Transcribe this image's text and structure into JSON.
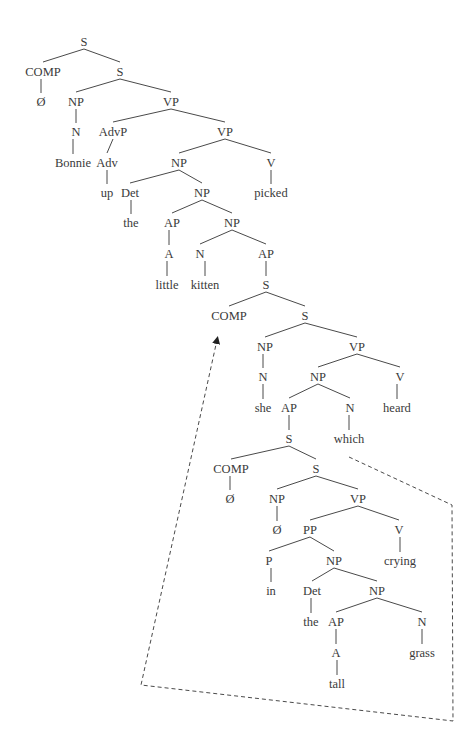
{
  "diagram": {
    "type": "syntax-tree",
    "sentence": "Bonnie up the little kitten she heard which in the tall grass crying picked",
    "nodes": [
      {
        "id": "s0",
        "label": "S",
        "x": 84,
        "y": 42
      },
      {
        "id": "comp0",
        "label": "COMP",
        "x": 43,
        "y": 72
      },
      {
        "id": "null0",
        "label": "Ø",
        "x": 41,
        "y": 102
      },
      {
        "id": "s1",
        "label": "S",
        "x": 120,
        "y": 72
      },
      {
        "id": "np1",
        "label": "NP",
        "x": 76,
        "y": 102
      },
      {
        "id": "n1",
        "label": "N",
        "x": 76,
        "y": 132
      },
      {
        "id": "bonnie",
        "label": "Bonnie",
        "x": 73,
        "y": 163
      },
      {
        "id": "vp1",
        "label": "VP",
        "x": 171,
        "y": 102
      },
      {
        "id": "advp",
        "label": "AdvP",
        "x": 113,
        "y": 132
      },
      {
        "id": "adv",
        "label": "Adv",
        "x": 107,
        "y": 163
      },
      {
        "id": "up",
        "label": "up",
        "x": 107,
        "y": 193
      },
      {
        "id": "vp2",
        "label": "VP",
        "x": 225,
        "y": 132
      },
      {
        "id": "np2",
        "label": "NP",
        "x": 179,
        "y": 163
      },
      {
        "id": "det1",
        "label": "Det",
        "x": 130,
        "y": 193
      },
      {
        "id": "the1",
        "label": "the",
        "x": 131,
        "y": 223
      },
      {
        "id": "np3",
        "label": "NP",
        "x": 202,
        "y": 193
      },
      {
        "id": "ap1",
        "label": "AP",
        "x": 172,
        "y": 223
      },
      {
        "id": "a1",
        "label": "A",
        "x": 169,
        "y": 254
      },
      {
        "id": "little",
        "label": "little",
        "x": 167,
        "y": 285
      },
      {
        "id": "np4",
        "label": "NP",
        "x": 232,
        "y": 223
      },
      {
        "id": "n2",
        "label": "N",
        "x": 200,
        "y": 254
      },
      {
        "id": "kitten",
        "label": "kitten",
        "x": 205,
        "y": 285
      },
      {
        "id": "ap2",
        "label": "AP",
        "x": 266,
        "y": 254
      },
      {
        "id": "s2",
        "label": "S",
        "x": 266,
        "y": 285
      },
      {
        "id": "comp1",
        "label": "COMP",
        "x": 229,
        "y": 316
      },
      {
        "id": "s3",
        "label": "S",
        "x": 305,
        "y": 316
      },
      {
        "id": "np5",
        "label": "NP",
        "x": 265,
        "y": 347
      },
      {
        "id": "n3",
        "label": "N",
        "x": 263,
        "y": 377
      },
      {
        "id": "she",
        "label": "she",
        "x": 263,
        "y": 408
      },
      {
        "id": "vp3",
        "label": "VP",
        "x": 357,
        "y": 347
      },
      {
        "id": "np6",
        "label": "NP",
        "x": 318,
        "y": 377
      },
      {
        "id": "ap3",
        "label": "AP",
        "x": 289,
        "y": 408
      },
      {
        "id": "s4",
        "label": "S",
        "x": 289,
        "y": 439
      },
      {
        "id": "n4",
        "label": "N",
        "x": 350,
        "y": 408
      },
      {
        "id": "which",
        "label": "which",
        "x": 349,
        "y": 439
      },
      {
        "id": "v1",
        "label": "V",
        "x": 400,
        "y": 377
      },
      {
        "id": "heard",
        "label": "heard",
        "x": 397,
        "y": 408
      },
      {
        "id": "comp2",
        "label": "COMP",
        "x": 231,
        "y": 469
      },
      {
        "id": "null1",
        "label": "Ø",
        "x": 230,
        "y": 499
      },
      {
        "id": "s5",
        "label": "S",
        "x": 316,
        "y": 469
      },
      {
        "id": "np7",
        "label": "NP",
        "x": 277,
        "y": 499
      },
      {
        "id": "null2",
        "label": "Ø",
        "x": 277,
        "y": 530
      },
      {
        "id": "vp4",
        "label": "VP",
        "x": 358,
        "y": 499
      },
      {
        "id": "pp",
        "label": "PP",
        "x": 310,
        "y": 530
      },
      {
        "id": "p",
        "label": "P",
        "x": 269,
        "y": 561
      },
      {
        "id": "in",
        "label": "in",
        "x": 271,
        "y": 591
      },
      {
        "id": "np8",
        "label": "NP",
        "x": 334,
        "y": 561
      },
      {
        "id": "det2",
        "label": "Det",
        "x": 312,
        "y": 591
      },
      {
        "id": "the2",
        "label": "the",
        "x": 311,
        "y": 622
      },
      {
        "id": "np9",
        "label": "NP",
        "x": 377,
        "y": 591
      },
      {
        "id": "ap4",
        "label": "AP",
        "x": 336,
        "y": 622
      },
      {
        "id": "a2",
        "label": "A",
        "x": 336,
        "y": 653
      },
      {
        "id": "tall",
        "label": "tall",
        "x": 337,
        "y": 684
      },
      {
        "id": "n5",
        "label": "N",
        "x": 422,
        "y": 622
      },
      {
        "id": "grass",
        "label": "grass",
        "x": 422,
        "y": 653
      },
      {
        "id": "v2",
        "label": "V",
        "x": 399,
        "y": 530
      },
      {
        "id": "crying",
        "label": "crying",
        "x": 400,
        "y": 561
      },
      {
        "id": "v3",
        "label": "V",
        "x": 271,
        "y": 163
      },
      {
        "id": "picked",
        "label": "picked",
        "x": 271,
        "y": 193
      }
    ],
    "edges": [
      [
        "s0",
        "comp0"
      ],
      [
        "s0",
        "s1"
      ],
      [
        "comp0",
        "null0"
      ],
      [
        "s1",
        "np1"
      ],
      [
        "s1",
        "vp1"
      ],
      [
        "np1",
        "n1"
      ],
      [
        "n1",
        "bonnie"
      ],
      [
        "vp1",
        "advp"
      ],
      [
        "vp1",
        "vp2"
      ],
      [
        "advp",
        "adv"
      ],
      [
        "adv",
        "up"
      ],
      [
        "vp2",
        "np2"
      ],
      [
        "vp2",
        "v3"
      ],
      [
        "v3",
        "picked"
      ],
      [
        "np2",
        "det1"
      ],
      [
        "np2",
        "np3"
      ],
      [
        "det1",
        "the1"
      ],
      [
        "np3",
        "ap1"
      ],
      [
        "np3",
        "np4"
      ],
      [
        "ap1",
        "a1"
      ],
      [
        "a1",
        "little"
      ],
      [
        "np4",
        "n2"
      ],
      [
        "np4",
        "ap2"
      ],
      [
        "n2",
        "kitten"
      ],
      [
        "ap2",
        "s2"
      ],
      [
        "s2",
        "comp1"
      ],
      [
        "s2",
        "s3"
      ],
      [
        "s3",
        "np5"
      ],
      [
        "s3",
        "vp3"
      ],
      [
        "np5",
        "n3"
      ],
      [
        "n3",
        "she"
      ],
      [
        "vp3",
        "np6"
      ],
      [
        "vp3",
        "v1"
      ],
      [
        "v1",
        "heard"
      ],
      [
        "np6",
        "ap3"
      ],
      [
        "np6",
        "n4"
      ],
      [
        "ap3",
        "s4"
      ],
      [
        "n4",
        "which"
      ],
      [
        "s4",
        "comp2"
      ],
      [
        "s4",
        "s5"
      ],
      [
        "comp2",
        "null1"
      ],
      [
        "s5",
        "np7"
      ],
      [
        "s5",
        "vp4"
      ],
      [
        "np7",
        "null2"
      ],
      [
        "vp4",
        "pp"
      ],
      [
        "vp4",
        "v2"
      ],
      [
        "v2",
        "crying"
      ],
      [
        "pp",
        "p"
      ],
      [
        "pp",
        "np8"
      ],
      [
        "p",
        "in"
      ],
      [
        "np8",
        "det2"
      ],
      [
        "np8",
        "np9"
      ],
      [
        "det2",
        "the2"
      ],
      [
        "np9",
        "ap4"
      ],
      [
        "np9",
        "n5"
      ],
      [
        "ap4",
        "a2"
      ],
      [
        "a2",
        "tall"
      ],
      [
        "n5",
        "grass"
      ]
    ],
    "movement_path": {
      "points": [
        [
          349,
          457
        ],
        [
          452,
          505
        ],
        [
          453,
          721
        ],
        [
          141,
          685
        ],
        [
          217,
          340
        ]
      ],
      "arrow_target": "comp1"
    },
    "colors": {
      "ink": "#3a3a3a",
      "line": "#4a4a4a",
      "background": "#ffffff"
    }
  }
}
